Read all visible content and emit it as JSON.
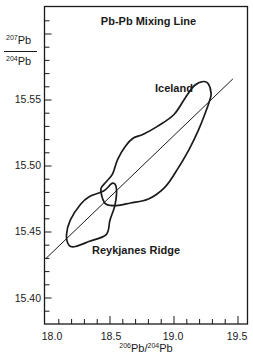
{
  "chart_data": {
    "type": "line",
    "title": "Pb-Pb Mixing Line",
    "xlabel": {
      "sup1": "206",
      "base1": "Pb/",
      "sup2": "204",
      "base2": "Pb"
    },
    "ylabel": {
      "num_sup": "207",
      "num_base": "Pb",
      "den_sup": "204",
      "den_base": "Pb"
    },
    "xlim": [
      18.0,
      19.6
    ],
    "ylim": [
      15.38,
      15.62
    ],
    "x_ticks": [
      "18.0",
      "18.5",
      "19.0",
      "19.5"
    ],
    "x_tick_values": [
      18.0,
      18.5,
      19.0,
      19.5
    ],
    "y_ticks": [
      "15.40",
      "15.45",
      "15.50",
      "15.55"
    ],
    "y_tick_values": [
      15.4,
      15.45,
      15.5,
      15.55
    ],
    "grid": false,
    "series": [
      {
        "name": "Mixing line",
        "kind": "line",
        "x": [
          18.0,
          19.46
        ],
        "y": [
          15.43,
          15.566
        ]
      },
      {
        "name": "Iceland",
        "kind": "field-outline",
        "x": [
          19.23,
          19.27,
          19.29,
          19.28,
          19.24,
          19.19,
          19.12,
          19.03,
          18.93,
          18.8,
          18.66,
          18.55,
          18.47,
          18.44,
          18.43,
          18.47,
          18.52,
          18.56,
          18.62,
          18.68,
          18.76,
          18.87,
          19.0,
          19.09,
          19.16
        ],
        "y": [
          15.564,
          15.562,
          15.555,
          15.55,
          15.539,
          15.527,
          15.513,
          15.498,
          15.484,
          15.475,
          15.472,
          15.47,
          15.471,
          15.476,
          15.483,
          15.488,
          15.494,
          15.505,
          15.515,
          15.521,
          15.524,
          15.53,
          15.539,
          15.552,
          15.561
        ]
      },
      {
        "name": "Reykjanes Ridge",
        "kind": "field-outline",
        "x": [
          18.16,
          18.19,
          18.27,
          18.34,
          18.45,
          18.52,
          18.55,
          18.54,
          18.5,
          18.47,
          18.34,
          18.23,
          18.18
        ],
        "y": [
          15.448,
          15.459,
          15.471,
          15.477,
          15.481,
          15.487,
          15.483,
          15.471,
          15.459,
          15.448,
          15.443,
          15.439,
          15.44
        ]
      }
    ],
    "annotations": [
      {
        "text": "Iceland",
        "x": 19.08,
        "y": 15.557
      },
      {
        "text": "Reykjanes Ridge",
        "x": 18.55,
        "y": 15.438
      }
    ]
  },
  "title": "Pb-Pb Mixing Line",
  "annotations": {
    "iceland": "Iceland",
    "reykjanes": "Reykjanes Ridge"
  },
  "axes": {
    "x_ticks": [
      "18.0",
      "18.5",
      "19.0",
      "19.5"
    ],
    "y_ticks": [
      "15.40",
      "15.45",
      "15.50",
      "15.55"
    ],
    "x_label": {
      "sup1": "206",
      "base1": "Pb/",
      "sup2": "204",
      "base2": "Pb"
    },
    "y_label": {
      "num_sup": "207",
      "num_base": "Pb",
      "den_sup": "204",
      "den_base": "Pb"
    }
  },
  "colors": {
    "ink": "#1a1a1a",
    "background": "#ffffff"
  }
}
